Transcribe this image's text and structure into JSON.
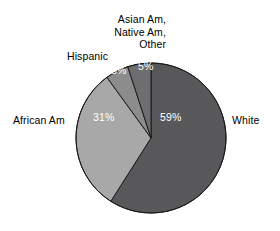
{
  "chart_data": {
    "type": "pie",
    "title": "",
    "subtitle": "",
    "xlabel": "",
    "ylabel": "",
    "legend_position": "none",
    "grid": false,
    "start_angle_deg": 0,
    "direction": "clockwise",
    "units": "percent",
    "total": 100,
    "categories": [
      "White",
      "African Am",
      "Hispanic",
      "Asian Am, Native Am, Other"
    ],
    "values": [
      59,
      31,
      5,
      5
    ],
    "value_labels": [
      "59%",
      "31%",
      "5%",
      "5%"
    ],
    "colors": [
      "#58585a",
      "#a8a8a8",
      "#8c8c8c",
      "#6e6e70"
    ],
    "slices": [
      {
        "label": "White",
        "label_lines": [
          "White"
        ],
        "value": 59,
        "value_label": "59%",
        "color": "#58585a",
        "label_color": "#000000",
        "value_label_color": "#ffffff"
      },
      {
        "label": "African Am",
        "label_lines": [
          "African Am"
        ],
        "value": 31,
        "value_label": "31%",
        "color": "#a8a8a8",
        "label_color": "#000000",
        "value_label_color": "#ffffff"
      },
      {
        "label": "Hispanic",
        "label_lines": [
          "Hispanic"
        ],
        "value": 5,
        "value_label": "5%",
        "color": "#8c8c8c",
        "label_color": "#000000",
        "value_label_color": "#ffffff"
      },
      {
        "label": "Asian Am, Native Am, Other",
        "label_lines": [
          "Asian Am,",
          "Native Am,",
          "Other"
        ],
        "value": 5,
        "value_label": "5%",
        "color": "#6e6e70",
        "label_color": "#000000",
        "value_label_color": "#ffffff"
      }
    ]
  },
  "figure": {
    "background": "#ffffff",
    "outline_color": "#000000",
    "center_x": 151,
    "center_y": 138,
    "radius": 75
  },
  "labels": {
    "african_am": "African Am",
    "white": "White",
    "hispanic": "Hispanic",
    "asian_other_line1": "Asian Am,",
    "asian_other_line2": "Native Am,",
    "asian_other_line3": "Other"
  },
  "percentages": {
    "white": "59%",
    "african_am": "31%",
    "hispanic": "5%",
    "asian_other": "5%"
  }
}
